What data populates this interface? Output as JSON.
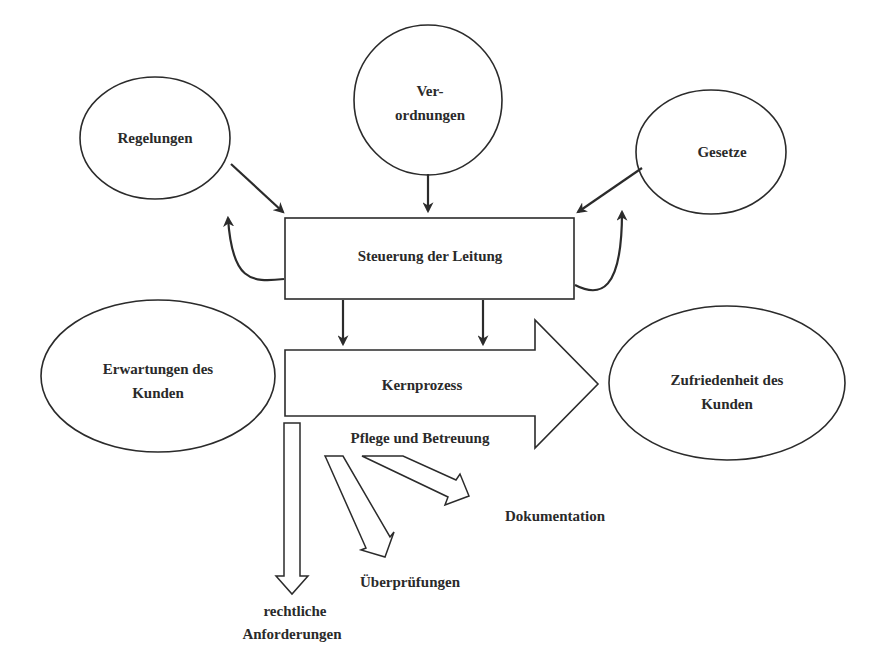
{
  "diagram": {
    "nodes": {
      "regelungen": {
        "label": "Regelungen"
      },
      "verordnungen": {
        "line1": "Ver-",
        "line2": "ordnungen"
      },
      "gesetze": {
        "label": "Gesetze"
      },
      "steuerung": {
        "label": "Steuerung der Leitung"
      },
      "erwartungen": {
        "line1": "Erwartungen des",
        "line2": "Kunden"
      },
      "kernprozess": {
        "label": "Kernprozess"
      },
      "pflege": {
        "label": "Pflege und Betreuung"
      },
      "zufriedenheit": {
        "line1": "Zufriedenheit des",
        "line2": "Kunden"
      },
      "dokumentation": {
        "label": "Dokumentation"
      },
      "ueberpruefungen": {
        "label": "Überprüfungen"
      },
      "rechtliche": {
        "line1": "rechtliche",
        "line2": "Anforderungen"
      }
    },
    "edges": [
      {
        "from": "Regelungen",
        "to": "Steuerung der Leitung"
      },
      {
        "from": "Verordnungen",
        "to": "Steuerung der Leitung"
      },
      {
        "from": "Gesetze",
        "to": "Steuerung der Leitung"
      },
      {
        "from": "Steuerung der Leitung",
        "to": "Regelungen"
      },
      {
        "from": "Steuerung der Leitung",
        "to": "Gesetze"
      },
      {
        "from": "Steuerung der Leitung",
        "to": "Kernprozess"
      },
      {
        "from": "Kernprozess",
        "to": "Zufriedenheit des Kunden"
      },
      {
        "from": "Pflege und Betreuung",
        "to": "Dokumentation"
      },
      {
        "from": "Pflege und Betreuung",
        "to": "Überprüfungen"
      },
      {
        "from": "Pflege und Betreuung",
        "to": "rechtliche Anforderungen"
      }
    ],
    "colors": {
      "stroke": "#2b2b2b",
      "text": "#2a2a2a",
      "background": "#ffffff"
    }
  }
}
